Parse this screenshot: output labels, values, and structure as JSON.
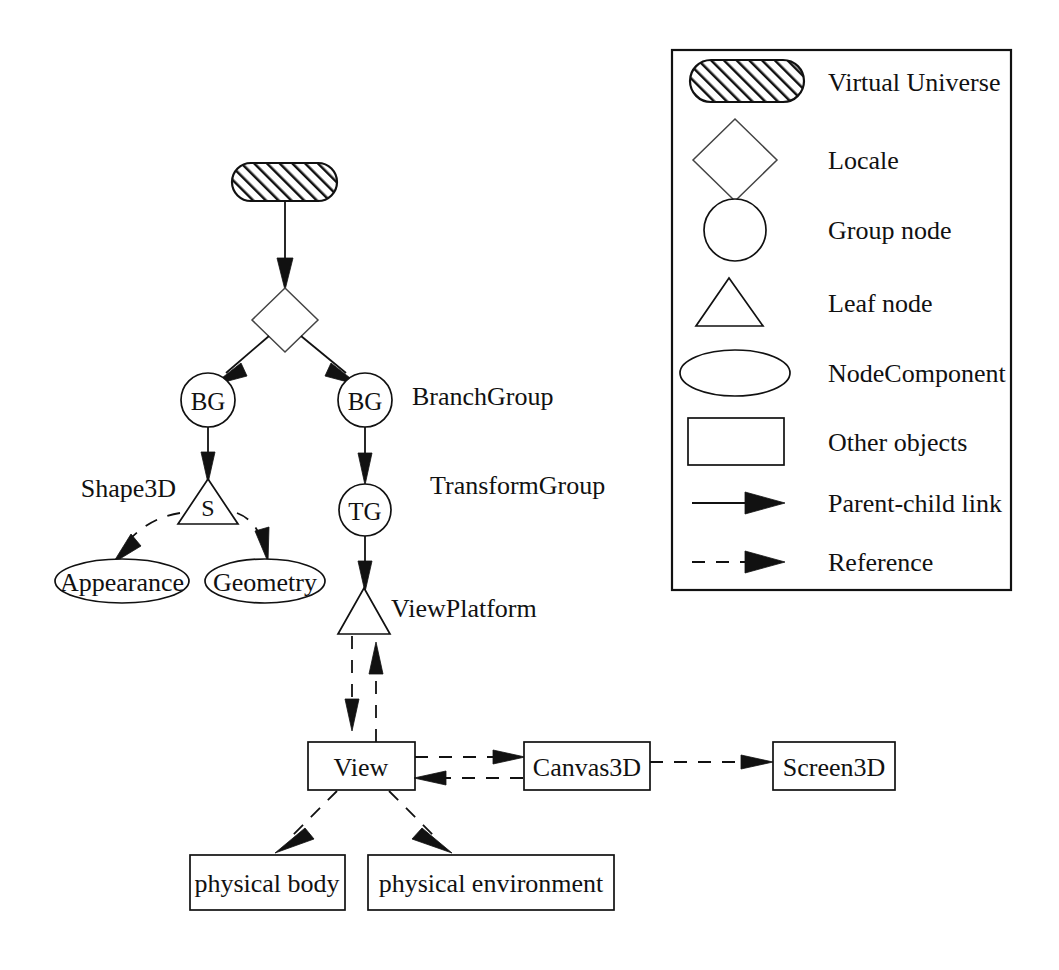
{
  "figure": {
    "kind": "scene-graph-diagram",
    "background_color": "#ffffff",
    "ink_color": "#111111"
  },
  "graph": {
    "nodes": [
      {
        "id": "virtual-universe",
        "shape": "rounded-rect-hatched",
        "label": "",
        "x": 284,
        "y": 181
      },
      {
        "id": "locale",
        "shape": "diamond",
        "label": "",
        "x": 285,
        "y": 320
      },
      {
        "id": "bg-left",
        "shape": "circle",
        "label": "BG",
        "x": 208,
        "y": 400
      },
      {
        "id": "bg-right",
        "shape": "circle",
        "label": "BG",
        "x": 365,
        "y": 400
      },
      {
        "id": "shape3d",
        "shape": "triangle",
        "label": "S",
        "x": 208,
        "y": 505
      },
      {
        "id": "transform-group",
        "shape": "circle",
        "label": "TG",
        "x": 365,
        "y": 510
      },
      {
        "id": "appearance",
        "shape": "ellipse",
        "label": "Appearance",
        "x": 122,
        "y": 581
      },
      {
        "id": "geometry",
        "shape": "ellipse",
        "label": "Geometry",
        "x": 265,
        "y": 581
      },
      {
        "id": "view-platform",
        "shape": "triangle",
        "label": "",
        "x": 364,
        "y": 612
      },
      {
        "id": "view",
        "shape": "rect",
        "label": "View",
        "x": 361,
        "y": 766
      },
      {
        "id": "canvas3d",
        "shape": "rect",
        "label": "Canvas3D",
        "x": 587,
        "y": 766
      },
      {
        "id": "screen3d",
        "shape": "rect",
        "label": "Screen3D",
        "x": 834,
        "y": 766
      },
      {
        "id": "physical-body",
        "shape": "rect",
        "label": "physical body",
        "x": 267,
        "y": 882
      },
      {
        "id": "physical-environment",
        "shape": "rect",
        "label": "physical environment",
        "x": 491,
        "y": 882
      }
    ],
    "annotations": [
      {
        "id": "branchgroup-label",
        "text": "BranchGroup",
        "x": 412,
        "y": 396,
        "align": "start"
      },
      {
        "id": "transformgroup-label",
        "text": "TransformGroup",
        "x": 430,
        "y": 485,
        "align": "start"
      },
      {
        "id": "shape3d-label",
        "text": "Shape3D",
        "x": 173,
        "y": 488,
        "align": "end"
      },
      {
        "id": "viewplatform-label",
        "text": "ViewPlatform",
        "x": 391,
        "y": 608,
        "align": "start"
      }
    ]
  },
  "legend": {
    "title": "",
    "frame": {
      "x": 672,
      "y": 50,
      "width": 339,
      "height": 540
    },
    "items": [
      {
        "key": "virtual-universe",
        "glyph": "rounded-rect-hatched",
        "label": "Virtual Universe"
      },
      {
        "key": "locale",
        "glyph": "diamond",
        "label": "Locale"
      },
      {
        "key": "group-node",
        "glyph": "circle",
        "label": "Group node"
      },
      {
        "key": "leaf-node",
        "glyph": "triangle",
        "label": "Leaf node"
      },
      {
        "key": "node-component",
        "glyph": "ellipse",
        "label": "NodeComponent"
      },
      {
        "key": "other-objects",
        "glyph": "rect",
        "label": "Other objects"
      },
      {
        "key": "parent-child-link",
        "glyph": "solid-arrow",
        "label": "Parent-child link"
      },
      {
        "key": "reference",
        "glyph": "dashed-arrow",
        "label": "Reference"
      }
    ]
  }
}
